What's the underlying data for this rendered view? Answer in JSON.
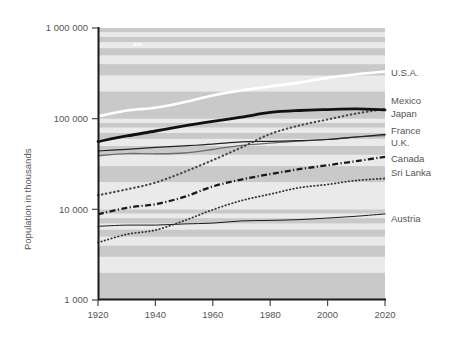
{
  "chart_data": {
    "type": "line",
    "title": "",
    "xlabel": "",
    "ylabel": "Population in thousands",
    "yscale": "log",
    "ylim": [
      1000,
      1000000
    ],
    "xlim": [
      1920,
      2020
    ],
    "xticks": [
      1920,
      1940,
      1960,
      1980,
      2000,
      2020
    ],
    "xtick_labels": [
      "1920",
      "1940",
      "1960",
      "1980",
      "2000",
      "2020"
    ],
    "yticks": [
      1000,
      10000,
      100000,
      1000000
    ],
    "ytick_labels": [
      "1 000",
      "10 000",
      "100 000",
      "1 000 000"
    ],
    "grid": "horizontal-alternating-bands",
    "legend_position": "right-of-axes",
    "background_bands": true,
    "x": [
      1920,
      1930,
      1940,
      1950,
      1960,
      1970,
      1980,
      1990,
      2000,
      2010,
      2020
    ],
    "series": [
      {
        "name": "U.S.A.",
        "style": "solid-white-thick",
        "color": "#ffffff",
        "values": [
          106000,
          123000,
          132000,
          152000,
          180000,
          205000,
          227000,
          250000,
          282000,
          309000,
          331000
        ]
      },
      {
        "name": "Mexico",
        "style": "dotted",
        "color": "#4a4a4a",
        "values": [
          14300,
          16600,
          19700,
          25800,
          34900,
          48200,
          67700,
          83900,
          98000,
          114000,
          128000
        ]
      },
      {
        "name": "Japan",
        "style": "solid-black-thick",
        "color": "#111111",
        "values": [
          55900,
          64400,
          73100,
          83200,
          93400,
          104000,
          117000,
          123000,
          126000,
          128000,
          125000
        ]
      },
      {
        "name": "France",
        "style": "solid-gray-thin",
        "color": "#6e6e6e",
        "values": [
          39000,
          41200,
          41000,
          41800,
          45700,
          50800,
          53700,
          56700,
          59000,
          62800,
          65000
        ]
      },
      {
        "name": "U.K.",
        "style": "solid-black-thin",
        "color": "#222222",
        "values": [
          44000,
          45900,
          48200,
          50100,
          52400,
          55600,
          56300,
          57200,
          58900,
          62800,
          67000
        ]
      },
      {
        "name": "Canada",
        "style": "dash-dot",
        "color": "#1a1a1a",
        "values": [
          8800,
          10400,
          11400,
          13700,
          17900,
          21300,
          24500,
          27700,
          30700,
          34000,
          38000
        ]
      },
      {
        "name": "Sri Lanka",
        "style": "fine-dotted",
        "color": "#333333",
        "values": [
          4300,
          5300,
          5900,
          7500,
          9900,
          12500,
          14700,
          17300,
          18800,
          20800,
          21900
        ]
      },
      {
        "name": "Austria",
        "style": "solid-black-hairline",
        "color": "#1a1a1a",
        "values": [
          6500,
          6700,
          6700,
          6900,
          7050,
          7450,
          7550,
          7700,
          8010,
          8390,
          8900
        ]
      }
    ],
    "legend_entries": [
      {
        "label": "U.S.A."
      },
      {
        "label": "Mexico"
      },
      {
        "label": "Japan"
      },
      {
        "label": "France"
      },
      {
        "label": "U.K."
      },
      {
        "label": "Canada"
      },
      {
        "label": "Sri Lanka"
      },
      {
        "label": "Austria"
      }
    ],
    "colors": {
      "band_light": "#eaeaea",
      "band_dark": "#c9c9c9",
      "axis": "#1a1a1a",
      "text": "#555555"
    }
  }
}
